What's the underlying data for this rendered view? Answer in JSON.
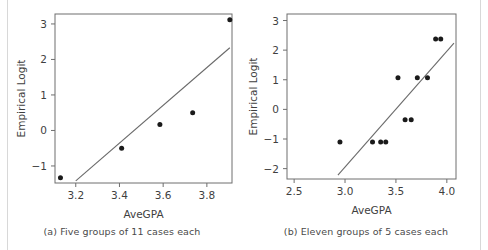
{
  "figure": {
    "title": "",
    "background_color": "#ffffff",
    "point_color": "#1a1a1a",
    "line_color": "#6a6a6a",
    "frame_color": "#6e6e6e"
  },
  "panels": [
    {
      "id": "a",
      "caption": "(a) Five groups of 11 cases each",
      "xlabel": "AveGPA",
      "ylabel": "Empirical Logit"
    },
    {
      "id": "b",
      "caption": "(b) Eleven groups of 5 cases each",
      "xlabel": "AveGPA",
      "ylabel": "Empirical Logit"
    }
  ],
  "chart_data": [
    {
      "type": "scatter",
      "panel": "a",
      "title": "(a) Five groups of 11 cases each",
      "xlabel": "AveGPA",
      "ylabel": "Empirical Logit",
      "xlim": [
        3.105,
        3.915
      ],
      "ylim": [
        -1.48,
        3.28
      ],
      "xticks": [
        3.2,
        3.4,
        3.6,
        3.8
      ],
      "xtick_labels": [
        "3.2",
        "3.4",
        "3.6",
        "3.8"
      ],
      "yticks": [
        -1,
        0,
        1,
        2,
        3
      ],
      "ytick_labels": [
        "-1",
        "0",
        "1",
        "2",
        "3"
      ],
      "grid": false,
      "legend": null,
      "x": [
        3.13,
        3.41,
        3.585,
        3.735,
        3.905
      ],
      "y": [
        -1.33,
        -0.5,
        0.17,
        0.5,
        3.12
      ],
      "fit_line": {
        "type": "line",
        "x": [
          3.2,
          3.905
        ],
        "y": [
          -1.42,
          2.33
        ]
      }
    },
    {
      "type": "scatter",
      "panel": "b",
      "title": "(b) Eleven groups of 5 cases each",
      "xlabel": "AveGPA",
      "ylabel": "Empirical Logit",
      "xlim": [
        2.43,
        4.09
      ],
      "ylim": [
        -2.35,
        3.22
      ],
      "xticks": [
        2.5,
        3.0,
        3.5,
        4.0
      ],
      "xtick_labels": [
        "2.5",
        "3.0",
        "3.5",
        "4.0"
      ],
      "yticks": [
        -2,
        -1,
        0,
        1,
        2,
        3
      ],
      "ytick_labels": [
        "-2",
        "-1",
        "0",
        "1",
        "2",
        "3"
      ],
      "grid": false,
      "legend": null,
      "x": [
        2.95,
        3.27,
        3.35,
        3.4,
        3.52,
        3.59,
        3.65,
        3.71,
        3.81,
        3.89,
        3.94
      ],
      "y": [
        -1.1,
        -1.1,
        -1.1,
        -1.1,
        1.07,
        -0.35,
        -0.35,
        1.07,
        1.07,
        2.38,
        2.38
      ],
      "fit_line": {
        "type": "line",
        "x": [
          2.93,
          4.07
        ],
        "y": [
          -2.22,
          2.24
        ]
      }
    }
  ]
}
